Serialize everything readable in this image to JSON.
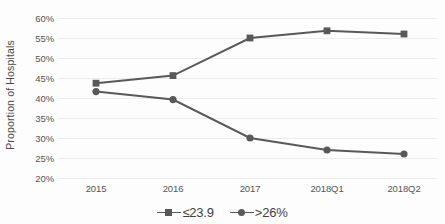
{
  "chart_data": {
    "type": "line",
    "title": "",
    "xlabel": "",
    "ylabel": "Proportion of Hospitals",
    "categories": [
      "2015",
      "2016",
      "2017",
      "2018Q1",
      "2018Q2"
    ],
    "ylim": [
      20,
      60
    ],
    "y_ticks": [
      "20%",
      "25%",
      "30%",
      "35%",
      "40%",
      "45%",
      "50%",
      "55%",
      "60%"
    ],
    "y_tick_values": [
      20,
      25,
      30,
      35,
      40,
      45,
      50,
      55,
      60
    ],
    "grid": true,
    "legend_position": "bottom",
    "series": [
      {
        "name": "≤23.9",
        "marker": "square",
        "color": "#595959",
        "values": [
          43.7,
          45.6,
          55.0,
          56.8,
          56.0
        ]
      },
      {
        "name": ">26%",
        "marker": "circle",
        "color": "#595959",
        "values": [
          41.6,
          39.6,
          30.0,
          27.0,
          26.0
        ]
      }
    ]
  },
  "legend": {
    "items": [
      {
        "label": "≤23.9",
        "marker": "square"
      },
      {
        "label": ">26%",
        "marker": "circle"
      }
    ]
  },
  "colors": {
    "series": "#595959",
    "gridline": "#ececec",
    "tick_text": "#555555",
    "axis_title": "#4a4a4a",
    "background": "#fdfdfd"
  }
}
